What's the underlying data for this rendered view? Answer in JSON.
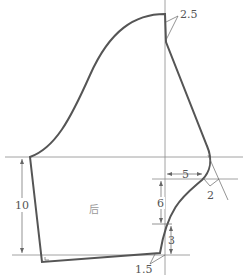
{
  "diagram": {
    "type": "sewing-pattern-sleeve-back",
    "piece_label": "后",
    "dimensions": {
      "top_offset": "2.5",
      "horizontal_offset": "5",
      "diagonal_offset": "2",
      "vertical_upper": "6",
      "vertical_lower": "3",
      "bottom_offset": "1.5",
      "left_height": "10"
    },
    "colors": {
      "outline": "#555555",
      "guide": "#8a8a8a"
    }
  }
}
